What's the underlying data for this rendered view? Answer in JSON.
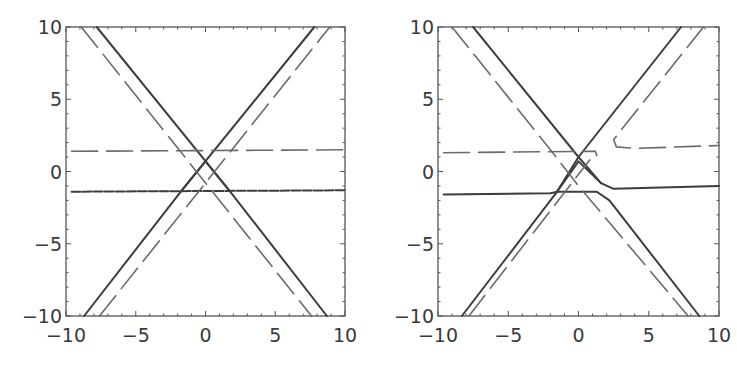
{
  "chart_data": [
    {
      "type": "line",
      "title": "",
      "xlabel": "",
      "ylabel": "",
      "xlim": [
        -10,
        10
      ],
      "ylim": [
        -10,
        10
      ],
      "x_ticks": [
        "-10",
        "-5",
        "0",
        "5",
        "10"
      ],
      "y_ticks": [
        "10",
        "5",
        "0",
        "-5",
        "-10"
      ],
      "grid": false,
      "legend": null,
      "series": [
        {
          "name": "solid-diag-down",
          "style": "solid",
          "points": [
            [
              -7.8,
              10
            ],
            [
              1.7,
              -1.3
            ],
            [
              8.7,
              -10
            ]
          ]
        },
        {
          "name": "solid-diag-up",
          "style": "solid",
          "points": [
            [
              -8.7,
              -10
            ],
            [
              -1.7,
              -1.3
            ],
            [
              7.8,
              10
            ]
          ]
        },
        {
          "name": "solid-inner-triangle",
          "style": "solid",
          "points": [
            [
              -1.7,
              -1.3
            ],
            [
              0,
              0.7
            ],
            [
              1.7,
              -1.3
            ]
          ]
        },
        {
          "name": "solid-horizontal",
          "style": "short-dash",
          "points": [
            [
              -9.6,
              -1.4
            ],
            [
              10,
              -1.3
            ]
          ]
        },
        {
          "name": "dashed-diag-down",
          "style": "long-dash",
          "points": [
            [
              -8.9,
              10
            ],
            [
              7.6,
              -10
            ]
          ]
        },
        {
          "name": "dashed-diag-up",
          "style": "long-dash",
          "points": [
            [
              -7.6,
              -10
            ],
            [
              8.9,
              10
            ]
          ]
        },
        {
          "name": "dashed-horizontal",
          "style": "long-dash",
          "points": [
            [
              -9.6,
              1.4
            ],
            [
              10,
              1.5
            ]
          ]
        }
      ]
    },
    {
      "type": "line",
      "title": "",
      "xlabel": "",
      "ylabel": "",
      "xlim": [
        -10,
        10
      ],
      "ylim": [
        -10,
        10
      ],
      "x_ticks": [
        "-10",
        "-5",
        "0",
        "5",
        "10"
      ],
      "y_ticks": [
        "10",
        "5",
        "0",
        "-5",
        "-10"
      ],
      "grid": false,
      "legend": null,
      "series": [
        {
          "name": "solid-diag-down-bend",
          "style": "solid",
          "points": [
            [
              -7.5,
              10
            ],
            [
              0,
              1.0
            ],
            [
              1.6,
              -0.8
            ],
            [
              2.5,
              -1.2
            ],
            [
              10,
              -1.0
            ]
          ]
        },
        {
          "name": "solid-diag-up",
          "style": "solid",
          "points": [
            [
              -8.3,
              -10
            ],
            [
              -1.6,
              -1.5
            ],
            [
              0,
              1.0
            ],
            [
              7.3,
              10
            ]
          ]
        },
        {
          "name": "solid-lower-arch",
          "style": "solid",
          "points": [
            [
              -9.6,
              -1.6
            ],
            [
              -2,
              -1.5
            ],
            [
              -1.5,
              -1.4
            ],
            [
              1.3,
              -1.4
            ],
            [
              2.2,
              -2.0
            ],
            [
              8.6,
              -10
            ]
          ]
        },
        {
          "name": "solid-inner-diamond",
          "style": "solid",
          "points": [
            [
              -1.6,
              -1.5
            ],
            [
              0,
              0.7
            ],
            [
              1.6,
              -0.8
            ]
          ]
        },
        {
          "name": "dashed-diag-down",
          "style": "long-dash",
          "points": [
            [
              -9,
              10
            ],
            [
              -2,
              1.5
            ],
            [
              0,
              -1.0
            ],
            [
              7.8,
              -10
            ]
          ]
        },
        {
          "name": "dashed-diag-up",
          "style": "long-dash",
          "points": [
            [
              -7.8,
              -10
            ],
            [
              0.8,
              0.8
            ]
          ]
        },
        {
          "name": "dashed-left-horizontal",
          "style": "long-dash",
          "points": [
            [
              -9.6,
              1.3
            ],
            [
              1.2,
              1.4
            ],
            [
              1.3,
              1.1
            ]
          ]
        },
        {
          "name": "dashed-right-branch",
          "style": "long-dash",
          "points": [
            [
              8.9,
              10
            ],
            [
              3.3,
              3.2
            ],
            [
              2.5,
              2.2
            ],
            [
              2.7,
              1.7
            ],
            [
              4,
              1.6
            ],
            [
              10,
              1.8
            ]
          ]
        }
      ]
    }
  ]
}
